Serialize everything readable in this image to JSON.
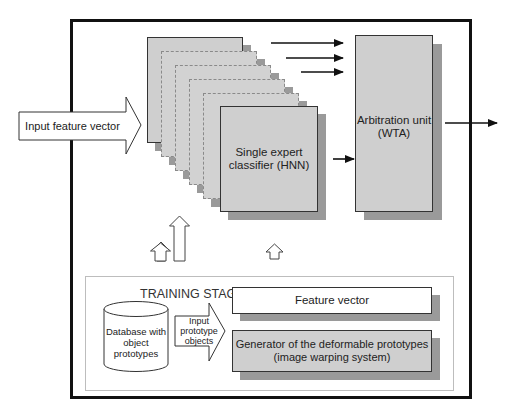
{
  "diagram": {
    "input_arrow": {
      "label": "Input feature vector"
    },
    "expert_classifier": {
      "label": "Single expert classifier (HNN)",
      "line1": "Single expert",
      "line2": "classifier (HNN)",
      "stack_layers": 6
    },
    "arbitration_unit": {
      "line1": "Arbitration unit",
      "line2": "(WTA)"
    },
    "training_stage": {
      "title": "TRAINING STAGE",
      "database": {
        "line1": "Database with",
        "line2": "object prototypes"
      },
      "input_arrow": {
        "line1": "Input",
        "line2": "prototype",
        "line3": "objects"
      },
      "feature_vector": {
        "label": "Feature vector"
      },
      "generator": {
        "line1": "Generator of the deformable prototypes",
        "line2": "(image warping system)"
      }
    },
    "colors": {
      "frame": "#111111",
      "box_fill": "#cfcfcf",
      "shadow": "#9a9a9a",
      "dashed_border": "#8a8a8a",
      "background": "#ffffff"
    }
  }
}
